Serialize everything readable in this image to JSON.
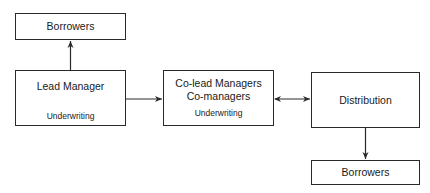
{
  "diagram": {
    "nodes": {
      "borrowers_top": {
        "label": "Borrowers"
      },
      "lead_manager": {
        "label": "Lead Manager",
        "sub": "Underwriting"
      },
      "co_lead": {
        "label_line1": "Co-lead Managers",
        "label_line2": "Co-managers",
        "sub": "Underwriting"
      },
      "distribution": {
        "label": "Distribution"
      },
      "borrowers_bottom": {
        "label": "Borrowers"
      }
    },
    "edges": [
      {
        "from": "lead_manager",
        "to": "borrowers_top",
        "type": "single-arrow"
      },
      {
        "from": "lead_manager",
        "to": "co_lead",
        "type": "single-arrow"
      },
      {
        "from": "co_lead",
        "to": "distribution",
        "type": "double-arrow"
      },
      {
        "from": "distribution",
        "to": "borrowers_bottom",
        "type": "single-arrow"
      }
    ],
    "colors": {
      "stroke": "#2a2a2a",
      "background": "#ffffff",
      "text": "#1a1a1a"
    }
  }
}
